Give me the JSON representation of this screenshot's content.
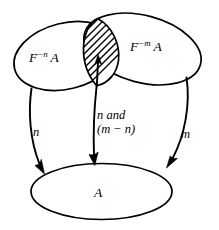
{
  "figure": {
    "kind": "set-diagram",
    "width": 219,
    "height": 230,
    "background_color": "#ffffff",
    "ink_color": "#000000",
    "sets": {
      "left": {
        "label_base": "F",
        "label_exponent": "−n",
        "label_operand": "A",
        "label_plain": "F⁻ⁿ A"
      },
      "right": {
        "label_base": "F",
        "label_exponent": "−m",
        "label_operand": "A",
        "label_plain": "F⁻ᵐ A"
      },
      "target": {
        "label": "A"
      },
      "intersection": {
        "fill_style": "diagonal-hatching",
        "label": ""
      }
    },
    "arrows": {
      "left": {
        "label": "n"
      },
      "center": {
        "label_line1": "n and",
        "label_line2": "(m − n)",
        "label_plain": "n and (m − n)"
      },
      "right": {
        "label": "m"
      }
    }
  }
}
